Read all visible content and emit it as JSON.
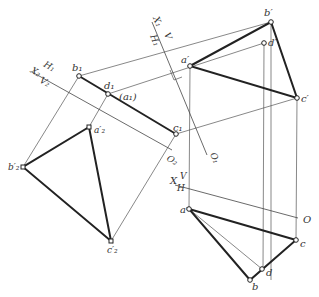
{
  "figure": {
    "points": {
      "b_prime": {
        "label": "b′",
        "x": 271,
        "y": 22
      },
      "d_prime": {
        "label": "d′",
        "x": 264,
        "y": 43
      },
      "a_prime": {
        "label": "a′",
        "x": 190,
        "y": 66
      },
      "c_prime": {
        "label": "c′",
        "x": 297,
        "y": 98
      },
      "b1": {
        "label": "b₁",
        "x": 79,
        "y": 76
      },
      "d1": {
        "label": "d₁",
        "x": 108,
        "y": 94
      },
      "a1": {
        "label": "(a₁)"
      },
      "c1": {
        "label": "c₁",
        "x": 176,
        "y": 134
      },
      "a2_prime": {
        "label": "a′₂",
        "x": 89,
        "y": 127
      },
      "b2_prime": {
        "label": "b′₂",
        "x": 23,
        "y": 167
      },
      "c2_prime": {
        "label": "c′₂",
        "x": 111,
        "y": 241
      },
      "a": {
        "label": "a",
        "x": 189,
        "y": 209
      },
      "c": {
        "label": "c",
        "x": 296,
        "y": 240
      },
      "d": {
        "label": "d",
        "x": 262,
        "y": 269
      },
      "b": {
        "label": "b",
        "x": 250,
        "y": 280
      }
    },
    "axes": {
      "xvh": {
        "x_label": "X",
        "v_label": "V",
        "h_label": "H",
        "origin_label": "O"
      },
      "x1": {
        "x_label": "X₁",
        "v_label": "V",
        "h_label": "H₁",
        "origin_label": "O₁"
      },
      "x2": {
        "x_label": "X₂",
        "v_label": "V₂",
        "h_label": "H₁",
        "origin_label": "O₂"
      }
    }
  }
}
